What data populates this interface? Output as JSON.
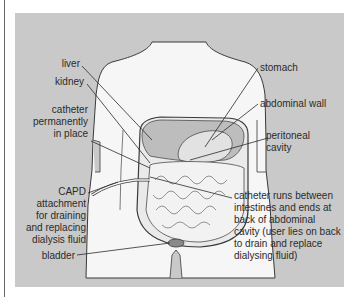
{
  "figure": {
    "background": "#c9c9c9",
    "body_fill": "#f6f6f6",
    "organ_fill": "#bdbdbd",
    "outline_color": "#3a3a3a",
    "labels": {
      "liver": "liver",
      "kidney": "kidney",
      "catheter_in_place": [
        "catheter",
        "permanently",
        "in place"
      ],
      "capd": [
        "CAPD",
        "attachment",
        "for draining",
        "and replacing",
        "dialysis fluid"
      ],
      "bladder": "bladder",
      "stomach": "stomach",
      "abdominal_wall": "abdominal wall",
      "peritoneal_cavity": [
        "peritoneal",
        "cavity"
      ],
      "catheter_runs": [
        "catheter runs between",
        "intestines and ends at",
        "back of abdominal",
        "cavity (user lies on back",
        "to drain and replace",
        "dialysing fluid)"
      ]
    }
  }
}
